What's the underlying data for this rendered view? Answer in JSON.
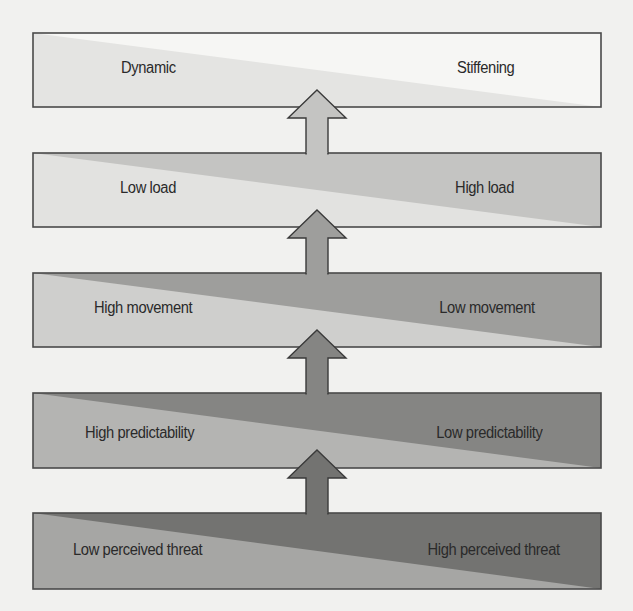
{
  "diagram": {
    "type": "stacked-continuum-levels",
    "direction": "bottom-to-top",
    "levels": [
      {
        "index": 0,
        "left_label": "Dynamic",
        "right_label": "Stiffening",
        "colors": {
          "light": "#e4e4e2",
          "dark": "#f6f6f4"
        }
      },
      {
        "index": 1,
        "left_label": "Low load",
        "right_label": "High load",
        "colors": {
          "light": "#e2e2e0",
          "dark": "#c4c4c2"
        }
      },
      {
        "index": 2,
        "left_label": "High movement",
        "right_label": "Low movement",
        "colors": {
          "light": "#cfcfcd",
          "dark": "#9e9e9c"
        }
      },
      {
        "index": 3,
        "left_label": "High predictability",
        "right_label": "Low predictability",
        "colors": {
          "light": "#b4b4b2",
          "dark": "#858583"
        }
      },
      {
        "index": 4,
        "left_label": "Low perceived threat",
        "right_label": "High perceived threat",
        "colors": {
          "light": "#a6a6a4",
          "dark": "#737371"
        }
      }
    ],
    "arrows": [
      {
        "from_level": 1,
        "to_level": 0,
        "fill": "#c4c4c2"
      },
      {
        "from_level": 2,
        "to_level": 1,
        "fill": "#9e9e9c"
      },
      {
        "from_level": 3,
        "to_level": 2,
        "fill": "#858583"
      },
      {
        "from_level": 4,
        "to_level": 3,
        "fill": "#737371"
      }
    ],
    "border_color": "#4a4a4a",
    "background": "#f1f1ef"
  }
}
